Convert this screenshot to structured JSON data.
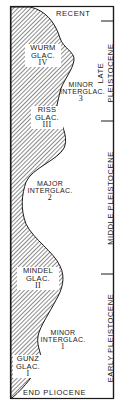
{
  "figure": {
    "top_label": "RECENT",
    "bottom_label": "END PLIOCENE",
    "stages": [
      {
        "name": "WURM",
        "type": "GLAC.",
        "number": "IV"
      },
      {
        "name": "MINOR",
        "type": "INTERGLAC.",
        "number": "3"
      },
      {
        "name": "RISS",
        "type": "GLAC.",
        "number": "III"
      },
      {
        "name": "MAJOR",
        "type": "INTERGLAC.",
        "number": "2"
      },
      {
        "name": "MINDEL",
        "type": "GLAC.",
        "number": "II"
      },
      {
        "name": "MINOR",
        "type": "INTERGLAC.",
        "number": "1"
      },
      {
        "name": "GUNZ",
        "type": "GLAC.",
        "number": "I"
      }
    ],
    "periods": [
      {
        "line1": "LATE",
        "line2": "PLEISTOCENE"
      },
      {
        "line1": "MIDDLE PLEISTOCENE"
      },
      {
        "line1": "EARLY PLEISTOCENE"
      }
    ],
    "colors": {
      "ink": "#1a1a1a",
      "paper": "#ffffff",
      "hatch": "#2a2a2a"
    }
  }
}
